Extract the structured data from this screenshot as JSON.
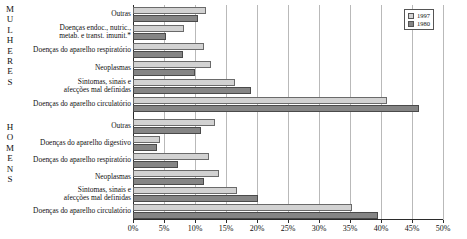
{
  "chart_data": {
    "type": "bar",
    "orientation": "horizontal",
    "title": "",
    "xlabel": "",
    "ylabel": "",
    "xlim": [
      0,
      50
    ],
    "grid": true,
    "legend_position": "top-right",
    "tick_labels": [
      "0%",
      "5%",
      "10%",
      "15%",
      "20%",
      "25%",
      "30%",
      "35%",
      "40%",
      "45%",
      "50%"
    ],
    "tick_values": [
      0,
      5,
      10,
      15,
      20,
      25,
      30,
      35,
      40,
      45,
      50
    ],
    "series_names": [
      "1997",
      "1980"
    ],
    "groups": [
      {
        "name": "MULHERES",
        "letters": [
          "M",
          "U",
          "L",
          "H",
          "E",
          "R",
          "E",
          "S"
        ],
        "categories": [
          "Outras",
          "Doenças endoc., nutric., metab. e transt. imunit.*",
          "Doenças do aparelho respiratório",
          "Neoplasmas",
          "Sintomas, sinais e afecções mal definidas",
          "Doenças do aparelho circulatório"
        ],
        "series": [
          {
            "name": "1997",
            "values": [
              11.8,
              8.2,
              11.5,
              12.5,
              16.5,
              41.0
            ]
          },
          {
            "name": "1980",
            "values": [
              10.5,
              5.3,
              8.0,
              10.0,
              19.0,
              46.2
            ]
          }
        ]
      },
      {
        "name": "HOMENS",
        "letters": [
          "H",
          "O",
          "M",
          "E",
          "N",
          "S"
        ],
        "categories": [
          "Outras",
          "Doenças do aparelho digestivo",
          "Doenças do aparelho respiratório",
          "Neoplasmas",
          "Sintomas, sinais e afecções mal definidas",
          "Doenças do aparelho circulatório"
        ],
        "series": [
          {
            "name": "1997",
            "values": [
              13.3,
              4.4,
              12.3,
              13.8,
              16.8,
              35.3
            ]
          },
          {
            "name": "1980",
            "values": [
              11.0,
              3.9,
              7.2,
              11.4,
              20.2,
              39.5
            ]
          }
        ]
      }
    ]
  },
  "legend": {
    "items": [
      {
        "label": "1997",
        "color": "#d2d2d2"
      },
      {
        "label": "1980",
        "color": "#858585"
      }
    ]
  },
  "labels": {
    "mulheres_letters": "M U L H E R E S",
    "homens_letters": "H O M E N S"
  }
}
